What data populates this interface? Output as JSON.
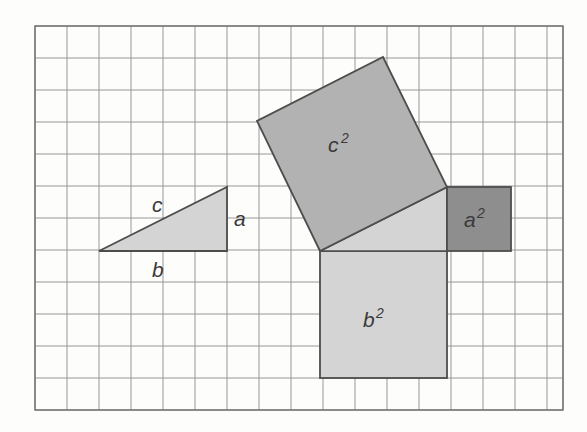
{
  "figure": {
    "background_color": "#fdfdfc",
    "grid": {
      "x": 35,
      "y": 26,
      "width": 528,
      "height": 384,
      "cell_size": 32,
      "columns": 16.5,
      "rows": 12,
      "line_color": "#8c8c8c",
      "border_color": "#6f6f6f",
      "visible": true
    },
    "colors": {
      "light_gray": "#d4d4d4",
      "medium_gray": "#b2b2b2",
      "dark_gray": "#8e8e8e",
      "outline": "#4d4d4d",
      "text": "#3a3a3a"
    },
    "shapes": {
      "reference_triangle": {
        "name": "reference-right-triangle",
        "fill": "#d4d4d4",
        "points": "99,251 227,251 227,187",
        "leg_a_length_cells": 2,
        "leg_b_length_cells": 4,
        "hypotenuse_length_cells": 4.472
      },
      "inner_triangle": {
        "name": "inner-right-triangle",
        "fill": "#d4d4d4",
        "points": "320,251 447,251 447,187"
      },
      "square_c": {
        "name": "square-c-squared",
        "fill": "#b2b2b2",
        "points": "320,251 257,121 383,57 447,187",
        "side_cells": 4.472,
        "area_cells": 20
      },
      "square_a": {
        "name": "square-a-squared",
        "fill": "#8e8e8e",
        "x": 447,
        "y": 187,
        "width": 64,
        "height": 64,
        "side_cells": 2,
        "area_cells": 4
      },
      "square_b": {
        "name": "square-b-squared",
        "fill": "#d4d4d4",
        "x": 320,
        "y": 251,
        "width": 127,
        "height": 127,
        "side_cells": 4,
        "area_cells": 16
      }
    },
    "labels": {
      "hypotenuse": {
        "text": "c",
        "x": 152,
        "y": 212
      },
      "leg_a": {
        "text": "a",
        "x": 234,
        "y": 226
      },
      "leg_b": {
        "text": "b",
        "x": 152,
        "y": 277
      },
      "square_c": {
        "base": "c",
        "exponent": "2",
        "x": 328,
        "y": 152
      },
      "square_a": {
        "base": "a",
        "exponent": "2",
        "x": 464,
        "y": 227
      },
      "square_b": {
        "base": "b",
        "exponent": "2",
        "x": 363,
        "y": 327
      }
    }
  },
  "chart_data": {
    "type": "diagram",
    "grid_unit": 1,
    "triangle_sides": {
      "a": 2,
      "b": 4,
      "c": 4.472
    },
    "areas": {
      "a_squared": 4,
      "b_squared": 16,
      "c_squared": 20
    },
    "labels": [
      "c",
      "a",
      "b",
      "c²",
      "a²",
      "b²"
    ]
  }
}
